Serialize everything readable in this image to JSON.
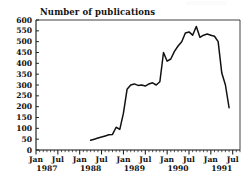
{
  "figure": {
    "title": "Number of publications",
    "background_color": "#ffffff",
    "line_color": "#111111",
    "axis_color": "#111111"
  },
  "chart_data": {
    "type": "line",
    "title": "Number of publications",
    "xlabel": "",
    "ylabel": "",
    "ylim": [
      0,
      600
    ],
    "ytick_values": [
      0,
      50,
      100,
      150,
      200,
      250,
      300,
      350,
      400,
      450,
      500,
      550,
      600
    ],
    "ytick_labels": [
      "0",
      "50",
      "100",
      "150",
      "200",
      "250",
      "300",
      "350",
      "400",
      "450",
      "500",
      "550",
      "600"
    ],
    "grid": false,
    "legend": false,
    "xtick_labels": [
      "Jan",
      "Jul",
      "Jan",
      "Jul",
      "Jan",
      "Jul",
      "Jan",
      "Jul",
      "Jan",
      "Jul"
    ],
    "xtick_months": [
      "1987-01",
      "1987-07",
      "1988-01",
      "1988-07",
      "1989-01",
      "1989-07",
      "1990-01",
      "1990-07",
      "1991-01",
      "1991-07"
    ],
    "year_labels": [
      "1987",
      "1988",
      "1989",
      "1990",
      "1991"
    ],
    "x_axis_start": "1987-01",
    "x_axis_end": "1991-09",
    "x": [
      "1988-04",
      "1988-05",
      "1988-06",
      "1988-07",
      "1988-08",
      "1988-09",
      "1988-10",
      "1988-11",
      "1988-12",
      "1989-01",
      "1989-02",
      "1989-03",
      "1989-04",
      "1989-05",
      "1989-06",
      "1989-07",
      "1989-08",
      "1989-09",
      "1989-10",
      "1989-11",
      "1989-12",
      "1990-01",
      "1990-02",
      "1990-03",
      "1990-04",
      "1990-05",
      "1990-06",
      "1990-07",
      "1990-08",
      "1990-09",
      "1990-10",
      "1990-11",
      "1990-12",
      "1991-01",
      "1991-02",
      "1991-03",
      "1991-04",
      "1991-05",
      "1991-06"
    ],
    "values": [
      45,
      50,
      55,
      60,
      65,
      70,
      72,
      105,
      95,
      170,
      280,
      300,
      305,
      298,
      300,
      295,
      305,
      310,
      300,
      315,
      450,
      410,
      420,
      455,
      480,
      500,
      540,
      545,
      530,
      570,
      520,
      530,
      535,
      530,
      525,
      500,
      355,
      300,
      195
    ]
  }
}
